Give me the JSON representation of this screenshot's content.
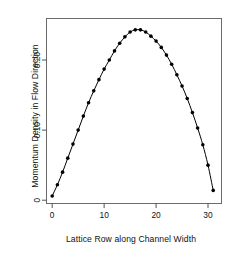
{
  "chart_data": {
    "type": "line",
    "title": "",
    "subtitle": "",
    "xlabel": "Lattice Row along Channel Width",
    "ylabel": "Momentum Density in Flow Direction",
    "xlim": [
      -1.0,
      32.5
    ],
    "ylim": [
      -0.004,
      0.2585
    ],
    "grid": false,
    "legend": null,
    "xticks": [
      0,
      10,
      20,
      30
    ],
    "xticklabels": [
      "0",
      "10",
      "20",
      "30"
    ],
    "yticks": [
      0,
      0.1,
      0.2
    ],
    "yticklabels": [
      "0",
      "0.10",
      "0.20"
    ],
    "marker": "filled-circle",
    "line_color": "#000000",
    "marker_color": "#000000",
    "frame_color": "#555555",
    "x": [
      0,
      1,
      2,
      3,
      4,
      5,
      6,
      7,
      8,
      9,
      10,
      11,
      12,
      13,
      14,
      15,
      16,
      17,
      18,
      19,
      20,
      21,
      22,
      23,
      24,
      25,
      26,
      27,
      28,
      29,
      30,
      31
    ],
    "values": [
      0.006,
      0.022,
      0.04,
      0.06,
      0.08,
      0.1,
      0.12,
      0.139,
      0.156,
      0.172,
      0.187,
      0.2,
      0.213,
      0.224,
      0.233,
      0.24,
      0.243,
      0.243,
      0.24,
      0.234,
      0.227,
      0.218,
      0.207,
      0.194,
      0.179,
      0.163,
      0.145,
      0.125,
      0.103,
      0.079,
      0.05,
      0.014
    ],
    "series": [
      {
        "name": "Momentum density profile",
        "values": [
          0.006,
          0.022,
          0.04,
          0.06,
          0.08,
          0.1,
          0.12,
          0.139,
          0.156,
          0.172,
          0.187,
          0.2,
          0.213,
          0.224,
          0.233,
          0.24,
          0.243,
          0.243,
          0.24,
          0.234,
          0.227,
          0.218,
          0.207,
          0.194,
          0.179,
          0.163,
          0.145,
          0.125,
          0.103,
          0.079,
          0.05,
          0.014
        ]
      }
    ]
  },
  "axes": {
    "x_title": "Lattice Row along Channel Width",
    "y_title": "Momentum Density in Flow Direction"
  }
}
